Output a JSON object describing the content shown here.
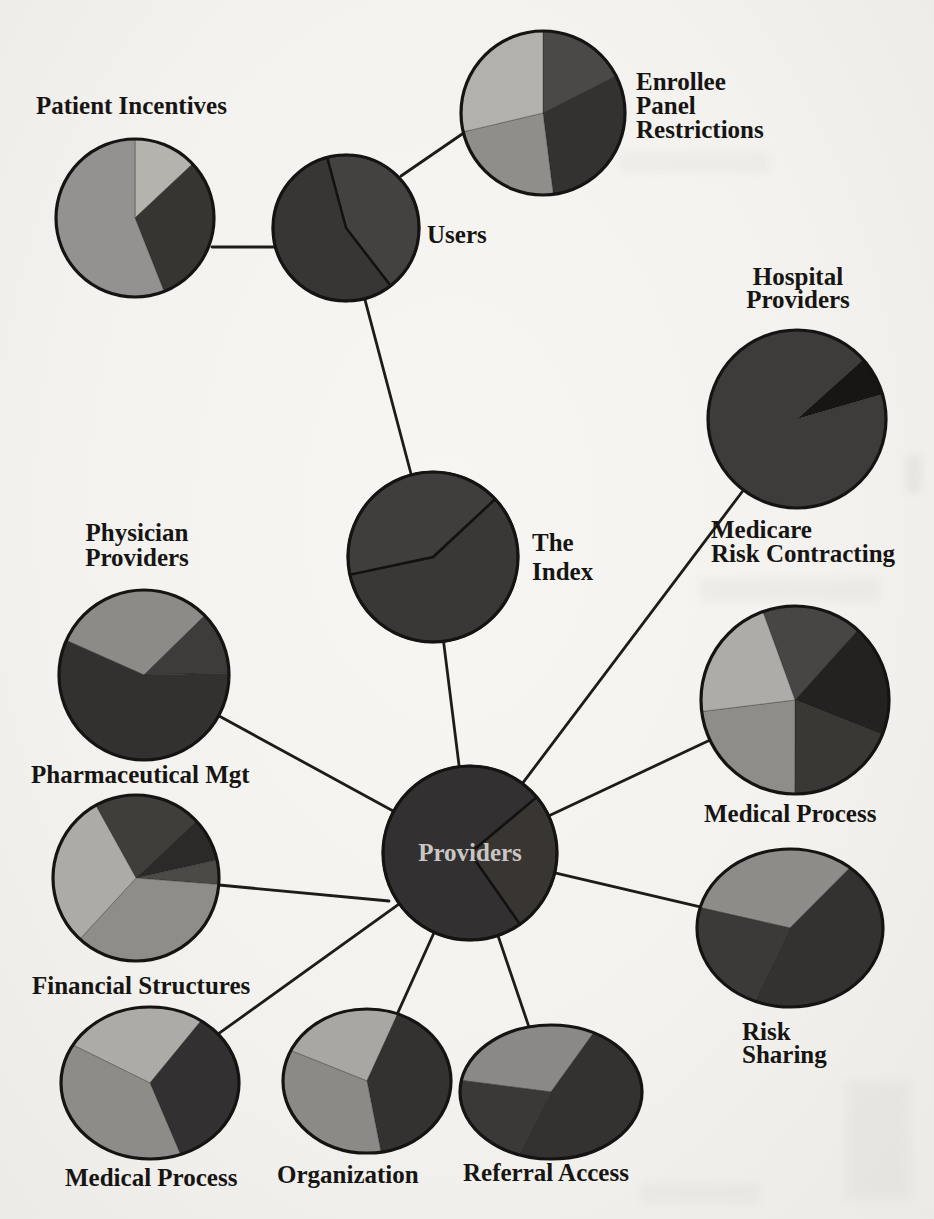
{
  "figure": {
    "hub_label": "Providers"
  },
  "colors": {
    "background": "#f3f2ee",
    "line": "#1e1c19",
    "outline": "#161412",
    "boundary": "#141210",
    "text": "#171513",
    "hub_text": "#c9c7c3",
    "gray_light": "#b0aeaa",
    "gray_medium": "#8f8d89",
    "gray_dark": "#3a3836",
    "near_black": "#1d1c1a"
  },
  "labels": [
    {
      "id": "lbl-patient",
      "text": "Patient Incentives",
      "node": "patient-incentives"
    },
    {
      "id": "lbl-enrollee",
      "text": "Enrollee\nPanel\nRestrictions",
      "node": "enrollee-panel-restrictions"
    },
    {
      "id": "lbl-users",
      "text": "Users",
      "node": "users"
    },
    {
      "id": "lbl-hospital",
      "text": "Hospital\nProviders",
      "node": "hospital-group-heading"
    },
    {
      "id": "lbl-index",
      "text": "The\nIndex",
      "node": "the-index"
    },
    {
      "id": "lbl-physician",
      "text": "Physician\nProviders",
      "node": "physician-group-heading"
    },
    {
      "id": "lbl-medicare",
      "text": "Medicare\nRisk Contracting",
      "node": "medicare-risk-contracting"
    },
    {
      "id": "lbl-pharm",
      "text": "Pharmaceutical Mgt",
      "node": "pharmaceutical-mgt"
    },
    {
      "id": "lbl-medproc-r",
      "text": "Medical Process",
      "node": "medical-process-right"
    },
    {
      "id": "lbl-financial",
      "text": "Financial Structures",
      "node": "financial-structures"
    },
    {
      "id": "lbl-risksharing",
      "text": "Risk\nSharing",
      "node": "risk-sharing"
    },
    {
      "id": "lbl-medproc-l",
      "text": "Medical Process",
      "node": "medical-process-left"
    },
    {
      "id": "lbl-organization",
      "text": "Organization",
      "node": "organization"
    },
    {
      "id": "lbl-referral",
      "text": "Referral Access",
      "node": "referral-access"
    },
    {
      "id": "lbl-providers-hub",
      "text": "Providers",
      "node": "providers"
    }
  ],
  "nodes": [
    {
      "id": "patient-incentives",
      "role": "dimension-pie",
      "pie": {
        "cx": 135,
        "cy": 218,
        "rx": 79,
        "ry": 79,
        "start": 0,
        "boundaries": "soft",
        "slices": [
          {
            "frac": 0.13,
            "color": "#b5b3ae",
            "shade": "light"
          },
          {
            "frac": 0.31,
            "color": "#373532",
            "shade": "dark"
          },
          {
            "frac": 0.56,
            "color": "#949290",
            "shade": "medium"
          }
        ]
      }
    },
    {
      "id": "enrollee-panel-restrictions",
      "role": "dimension-pie",
      "pie": {
        "cx": 543,
        "cy": 113,
        "rx": 82,
        "ry": 82,
        "start": 0,
        "boundaries": "soft",
        "slices": [
          {
            "frac": 0.175,
            "color": "#4b4947",
            "shade": "dark-gray"
          },
          {
            "frac": 0.305,
            "color": "#343230",
            "shade": "dark"
          },
          {
            "frac": 0.233,
            "color": "#908e8a",
            "shade": "medium"
          },
          {
            "frac": 0.287,
            "color": "#b3b1ad",
            "shade": "light"
          }
        ]
      }
    },
    {
      "id": "users",
      "role": "hub-pie",
      "pie": {
        "cx": 346,
        "cy": 228,
        "rx": 73,
        "ry": 73,
        "start": 345,
        "boundaries": "dark",
        "slices": [
          {
            "frac": 0.437,
            "color": "#444240",
            "shade": "dark"
          },
          {
            "frac": 0.563,
            "color": "#383634",
            "shade": "dark"
          }
        ]
      }
    },
    {
      "id": "the-index",
      "role": "hub-pie",
      "pie": {
        "cx": 433,
        "cy": 557,
        "rx": 85,
        "ry": 85,
        "start": 47,
        "boundaries": "dark",
        "slices": [
          {
            "frac": 0.586,
            "color": "#3a3836",
            "shade": "dark"
          },
          {
            "frac": 0.414,
            "color": "#403e3d",
            "shade": "dark"
          }
        ]
      }
    },
    {
      "id": "providers",
      "role": "hub-pie",
      "pie": {
        "cx": 470,
        "cy": 853,
        "rx": 87,
        "ry": 87,
        "start": 50,
        "boundaries": "dark",
        "slices": [
          {
            "frac": 0.264,
            "color": "#383533",
            "shade": "dark"
          },
          {
            "frac": 0.736,
            "color": "#323030",
            "shade": "dark"
          }
        ]
      }
    },
    {
      "id": "medicare-risk-contracting",
      "role": "dimension-pie",
      "pie": {
        "cx": 797,
        "cy": 419,
        "rx": 89,
        "ry": 89,
        "start": 48,
        "boundaries": "soft",
        "slices": [
          {
            "frac": 0.072,
            "color": "#171614",
            "shade": "black"
          },
          {
            "frac": 0.928,
            "color": "#3e3c3a",
            "shade": "dark"
          }
        ]
      }
    },
    {
      "id": "medical-process-right",
      "role": "dimension-pie",
      "pie": {
        "cx": 795,
        "cy": 700,
        "rx": 94,
        "ry": 94,
        "start": 340,
        "boundaries": "soft",
        "slices": [
          {
            "frac": 0.172,
            "color": "#484644",
            "shade": "dark-gray"
          },
          {
            "frac": 0.194,
            "color": "#232221",
            "shade": "black"
          },
          {
            "frac": 0.19,
            "color": "#3a3835",
            "shade": "dark"
          },
          {
            "frac": 0.23,
            "color": "#8f8d89",
            "shade": "medium"
          },
          {
            "frac": 0.214,
            "color": "#aeaca8",
            "shade": "light"
          }
        ]
      }
    },
    {
      "id": "risk-sharing",
      "role": "dimension-pie",
      "pie": {
        "cx": 790,
        "cy": 928,
        "rx": 93,
        "ry": 79,
        "start": 285,
        "boundaries": "soft",
        "slices": [
          {
            "frac": 0.32,
            "color": "#8e8c88",
            "shade": "medium"
          },
          {
            "frac": 0.45,
            "color": "#343231",
            "shade": "dark"
          },
          {
            "frac": 0.23,
            "color": "#3c3a38",
            "shade": "dark"
          }
        ]
      }
    },
    {
      "id": "pharmaceutical-mgt",
      "role": "dimension-pie",
      "pie": {
        "cx": 144,
        "cy": 675,
        "rx": 85,
        "ry": 85,
        "start": 294,
        "boundaries": "soft",
        "slices": [
          {
            "frac": 0.31,
            "color": "#8d8b88",
            "shade": "medium"
          },
          {
            "frac": 0.12,
            "color": "#3e3c3a",
            "shade": "dark-gray"
          },
          {
            "frac": 0.57,
            "color": "#333130",
            "shade": "dark"
          }
        ]
      }
    },
    {
      "id": "financial-structures",
      "role": "dimension-pie",
      "pie": {
        "cx": 136,
        "cy": 878,
        "rx": 83,
        "ry": 83,
        "start": 331,
        "boundaries": "soft",
        "slices": [
          {
            "frac": 0.21,
            "color": "#403e3b",
            "shade": "dark"
          },
          {
            "frac": 0.086,
            "color": "#2b2a28",
            "shade": "black"
          },
          {
            "frac": 0.047,
            "color": "#4c4a47",
            "shade": "dark-gray"
          },
          {
            "frac": 0.356,
            "color": "#8f8d89",
            "shade": "medium"
          },
          {
            "frac": 0.301,
            "color": "#adaba7",
            "shade": "light"
          }
        ]
      }
    },
    {
      "id": "medical-process-left",
      "role": "dimension-pie",
      "pie": {
        "cx": 150,
        "cy": 1083,
        "rx": 89,
        "ry": 76,
        "start": 300,
        "boundaries": "soft",
        "slices": [
          {
            "frac": 0.264,
            "color": "#adaba7",
            "shade": "light"
          },
          {
            "frac": 0.347,
            "color": "#323030",
            "shade": "dark"
          },
          {
            "frac": 0.389,
            "color": "#8e8c88",
            "shade": "medium"
          }
        ]
      }
    },
    {
      "id": "organization",
      "role": "dimension-pie",
      "pie": {
        "cx": 367,
        "cy": 1081,
        "rx": 84,
        "ry": 72,
        "start": 295,
        "boundaries": "soft",
        "slices": [
          {
            "frac": 0.24,
            "color": "#a9a7a3",
            "shade": "light"
          },
          {
            "frac": 0.414,
            "color": "#343230",
            "shade": "dark"
          },
          {
            "frac": 0.346,
            "color": "#8c8a86",
            "shade": "medium"
          }
        ]
      }
    },
    {
      "id": "referral-access",
      "role": "dimension-pie",
      "pie": {
        "cx": 551,
        "cy": 1092,
        "rx": 91,
        "ry": 67,
        "start": 280,
        "boundaries": "soft",
        "slices": [
          {
            "frac": 0.3,
            "color": "#8b8987",
            "shade": "medium"
          },
          {
            "frac": 0.48,
            "color": "#343231",
            "shade": "dark"
          },
          {
            "frac": 0.22,
            "color": "#3b3937",
            "shade": "dark"
          }
        ]
      }
    }
  ],
  "edges": [
    {
      "from": "patient-incentives",
      "to": "users",
      "pts": [
        [
          212,
          247
        ],
        [
          278,
          247
        ]
      ]
    },
    {
      "from": "users",
      "to": "enrollee-panel-restrictions",
      "pts": [
        [
          401,
          176
        ],
        [
          468,
          130
        ]
      ]
    },
    {
      "from": "users",
      "to": "the-index"
    },
    {
      "from": "the-index",
      "to": "providers"
    },
    {
      "from": "providers",
      "to": "pharmaceutical-mgt"
    },
    {
      "from": "providers",
      "to": "financial-structures",
      "pts": [
        [
          219,
          885
        ],
        [
          389,
          901
        ]
      ]
    },
    {
      "from": "providers",
      "to": "medical-process-left"
    },
    {
      "from": "providers",
      "to": "organization"
    },
    {
      "from": "providers",
      "to": "referral-access"
    },
    {
      "from": "providers",
      "to": "risk-sharing"
    },
    {
      "from": "providers",
      "to": "medical-process-right"
    },
    {
      "from": "providers",
      "to": "medicare-risk-contracting"
    }
  ],
  "artifacts": [
    {
      "x": 620,
      "y": 152,
      "w": 150,
      "h": 20,
      "opacity": 0.05
    },
    {
      "x": 700,
      "y": 578,
      "w": 180,
      "h": 24,
      "opacity": 0.06
    },
    {
      "x": 845,
      "y": 1080,
      "w": 66,
      "h": 120,
      "opacity": 0.05
    },
    {
      "x": 640,
      "y": 1182,
      "w": 120,
      "h": 22,
      "opacity": 0.05
    },
    {
      "x": 906,
      "y": 455,
      "w": 16,
      "h": 38,
      "opacity": 0.09
    }
  ]
}
